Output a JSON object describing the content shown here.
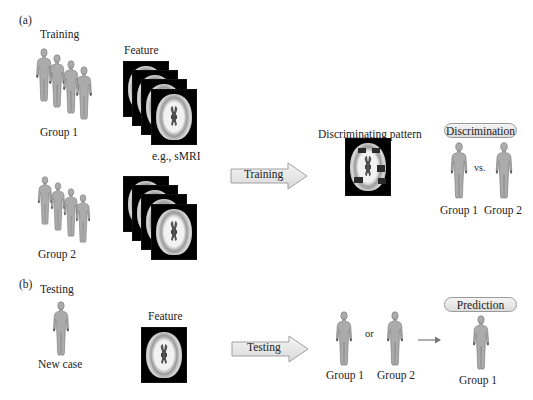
{
  "panel_a": {
    "label": "(a)",
    "title": "Training",
    "feature_label": "Feature",
    "modality_label": "e.g., sMRI",
    "groups": [
      {
        "label": "Group 1",
        "icon": "person-group-icon"
      },
      {
        "label": "Group 2",
        "icon": "person-group-icon"
      }
    ],
    "arrow_label": "Training",
    "pattern_label": "Discriminating pattern",
    "discrimination": {
      "badge": "Discrimination",
      "left": "Group 1",
      "vs": "vs.",
      "right": "Group 2"
    }
  },
  "panel_b": {
    "label": "(b)",
    "title": "Testing",
    "subject_label": "New case",
    "feature_label": "Feature",
    "arrow_label": "Testing",
    "choices": {
      "left": "Group 1",
      "or": "or",
      "right": "Group 2"
    },
    "prediction": {
      "badge": "Prediction",
      "result": "Group 1"
    }
  },
  "colors": {
    "figure_fill": "#a9a9a9",
    "figure_stroke": "#6e6e6e",
    "arrow_fill": "#e8e8e8",
    "arrow_stroke": "#a0a0a0",
    "pill_fill": "#e6e6e6",
    "connector_arrow": "#777777"
  }
}
